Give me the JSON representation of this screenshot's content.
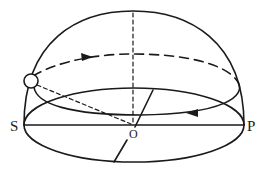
{
  "diagram": {
    "type": "celestial-sphere-sun-path",
    "labels": {
      "south": "S",
      "north": "P",
      "center": "O"
    },
    "elements": [
      "hemisphere-dome",
      "horizon-plane-ellipse",
      "sun-path-ellipse",
      "zenith-axis-dashed",
      "sun",
      "sun-to-observer-line",
      "meridian-baseline",
      "gnomon-line"
    ],
    "colors": {
      "stroke": "#1a1a1a",
      "background": "#ffffff"
    }
  }
}
